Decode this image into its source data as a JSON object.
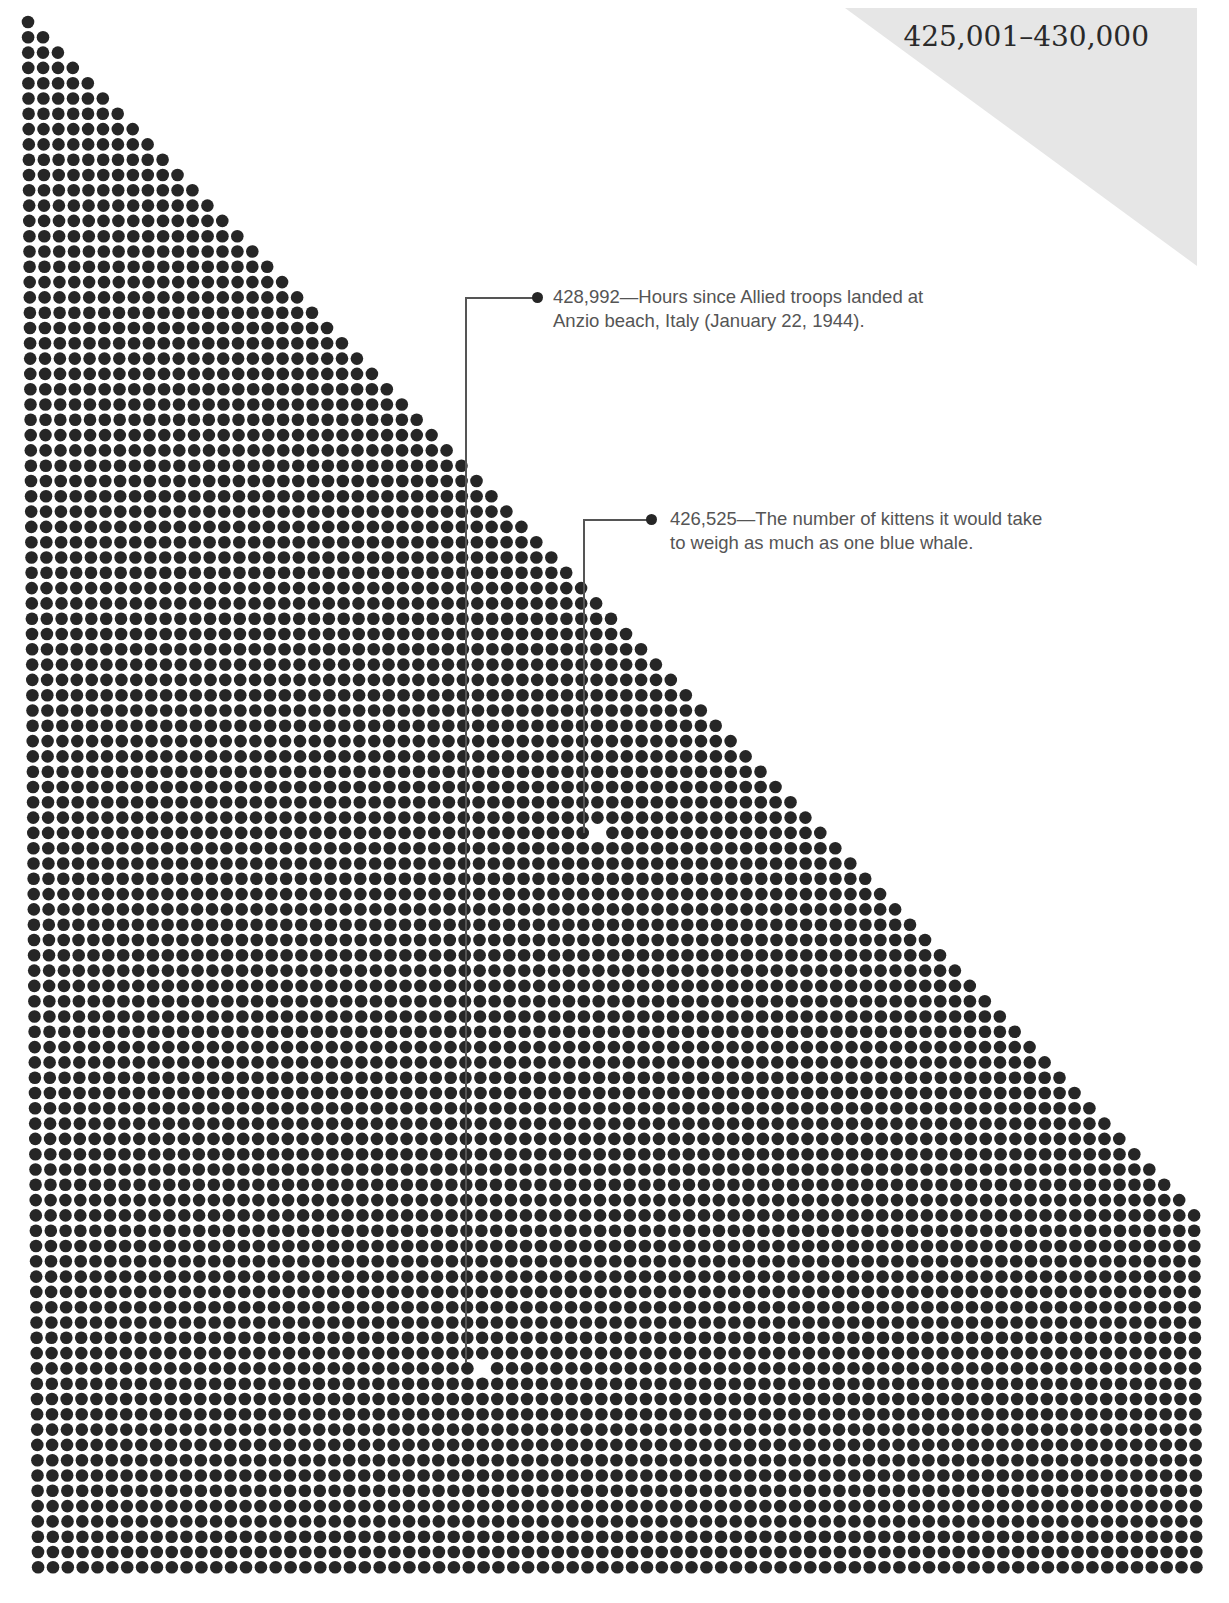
{
  "header": {
    "range_label": "425,001–430,000"
  },
  "grid": {
    "columns": 79,
    "rows": 102,
    "origin_x": 28,
    "origin_y": 22,
    "pitch_x": 14.85,
    "pitch_y": 15.3,
    "dot_diameter": 12.6,
    "dot_color": "#262626",
    "gap_color": "#ffffff"
  },
  "callouts": [
    {
      "value": "428,992",
      "text_line1": "428,992—Hours since Allied troops landed at",
      "text_line2": "Anzio beach, Italy (January 22, 1944).",
      "gap_col": 30,
      "gap_row": 88
    },
    {
      "value": "426,525",
      "text_line1": "426,525—The number of kittens it would take",
      "text_line2": "to weigh as much as one blue whale.",
      "gap_col": 38,
      "gap_row": 53
    }
  ],
  "chart_data": {
    "type": "scatter",
    "title": "425,001–430,000",
    "range": [
      425001,
      430000
    ],
    "dot_count": 5000,
    "annotations": [
      {
        "value": 428992,
        "label": "Hours since Allied troops landed at Anzio beach, Italy (January 22, 1944)."
      },
      {
        "value": 426525,
        "label": "The number of kittens it would take to weigh as much as one blue whale."
      }
    ],
    "xlabel": "",
    "ylabel": "",
    "grid": false
  }
}
